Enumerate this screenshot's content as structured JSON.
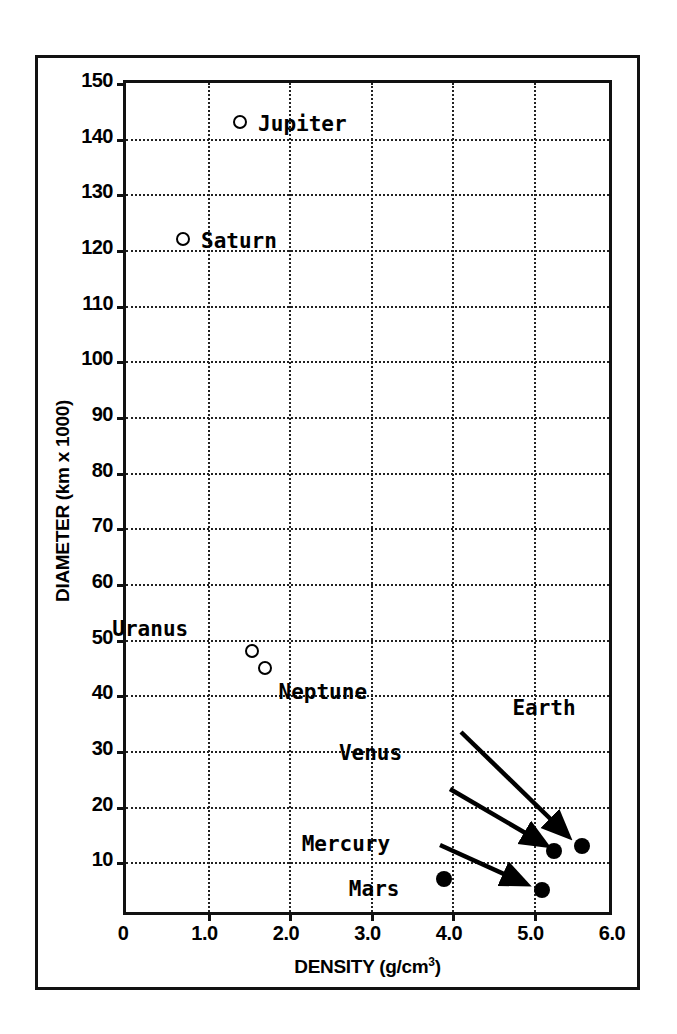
{
  "chart_data": {
    "type": "scatter",
    "title": "",
    "xlabel": "DENSITY (g/cm³)",
    "xlabel_base": "DENSITY (g/cm",
    "xlabel_sup": "3",
    "xlabel_close": ")",
    "ylabel": "DIAMETER (km x 1000)",
    "xlim": [
      0,
      6.0
    ],
    "ylim": [
      0,
      150
    ],
    "grid": true,
    "grid_style": "dotted",
    "legend": "none",
    "xticks": [
      "0",
      "1.0",
      "2.0",
      "3.0",
      "4.0",
      "5.0",
      "6.0"
    ],
    "xtick_values": [
      0,
      1.0,
      2.0,
      3.0,
      4.0,
      5.0,
      6.0
    ],
    "yticks": [
      "10",
      "20",
      "30",
      "40",
      "50",
      "60",
      "70",
      "80",
      "90",
      "100",
      "110",
      "120",
      "130",
      "140",
      "150"
    ],
    "ytick_values": [
      10,
      20,
      30,
      40,
      50,
      60,
      70,
      80,
      90,
      100,
      110,
      120,
      130,
      140,
      150
    ],
    "points": [
      {
        "name": "Jupiter",
        "density": 1.4,
        "diameter": 143,
        "marker": "open",
        "label_dx": 18,
        "label_dy": -10
      },
      {
        "name": "Saturn",
        "density": 0.7,
        "diameter": 122,
        "marker": "open",
        "label_dx": 18,
        "label_dy": -10
      },
      {
        "name": "Uranus",
        "density": 1.55,
        "diameter": 48,
        "marker": "open",
        "label_dx": -140,
        "label_dy": -34
      },
      {
        "name": "Neptune",
        "density": 1.7,
        "diameter": 45,
        "marker": "open",
        "label_dx": 14,
        "label_dy": 12
      },
      {
        "name": "Earth",
        "density": 5.6,
        "diameter": 13,
        "marker": "filled",
        "label_dx": -70,
        "label_dy": -150
      },
      {
        "name": "Venus",
        "density": 5.25,
        "diameter": 12,
        "marker": "filled",
        "label_dx": -215,
        "label_dy": -110
      },
      {
        "name": "Mercury",
        "density": 5.1,
        "diameter": 5,
        "marker": "filled",
        "label_dx": -240,
        "label_dy": -58
      },
      {
        "name": "Mars",
        "density": 3.9,
        "diameter": 7,
        "marker": "filled",
        "label_dx": -95,
        "label_dy": -2
      }
    ],
    "annotations": [
      {
        "label": "Earth",
        "from": [
          461,
          732
        ],
        "to": [
          568,
          836
        ]
      },
      {
        "label": "Venus",
        "from": [
          450,
          789
        ],
        "to": [
          546,
          845
        ]
      },
      {
        "label": "Mercury",
        "from": [
          440,
          845
        ],
        "to": [
          526,
          884
        ]
      }
    ]
  }
}
